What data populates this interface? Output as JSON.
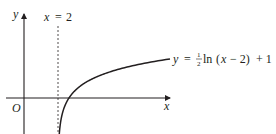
{
  "diagram": {
    "axes": {
      "x_label": "x",
      "y_label": "y",
      "origin_label": "O"
    },
    "asymptote": {
      "label_var": "x",
      "label_eq": "=",
      "label_val": "2",
      "x_value": 2,
      "style": "dashed"
    },
    "curve": {
      "equation_text": "y = ½ln (x − 2) + 1",
      "lhs": "y",
      "eq": "=",
      "frac_num": "1",
      "frac_den": "2",
      "fn": "ln",
      "arg_open": "(",
      "arg_var": "x",
      "arg_rest": " − 2)",
      "plus": "+ 1"
    },
    "colors": {
      "ink": "#231f20",
      "background": "#ffffff"
    }
  }
}
